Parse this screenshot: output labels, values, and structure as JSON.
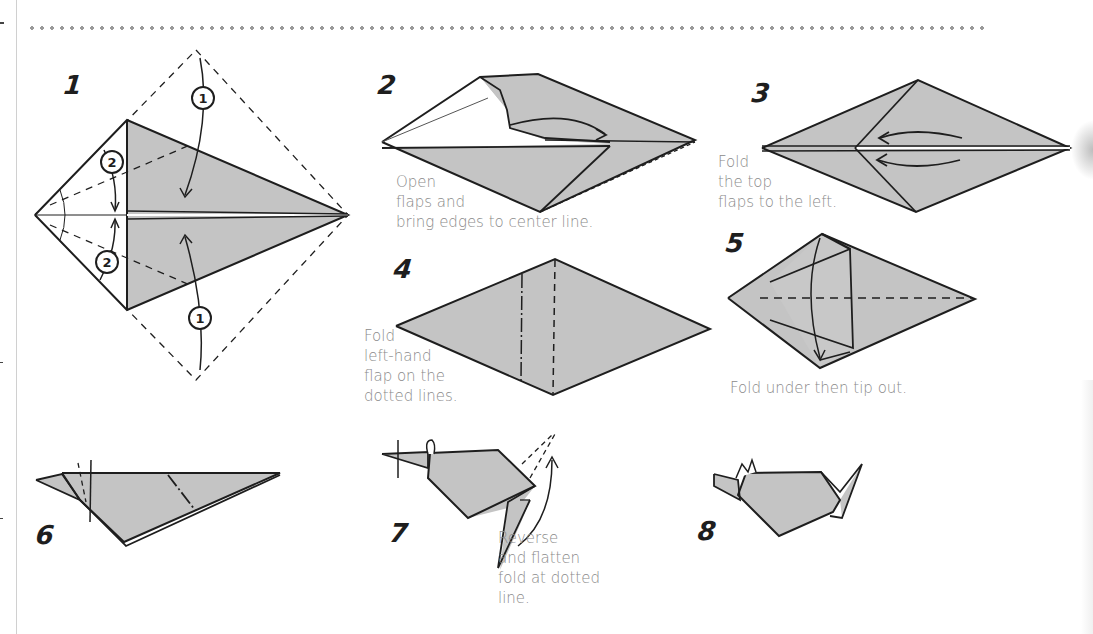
{
  "page": {
    "colors": {
      "paper": "#c4c4c4",
      "line": "#1e1e1e",
      "caption": "#8a8a8a",
      "dots": "#9a9a9a"
    }
  },
  "steps": [
    {
      "number": "1",
      "caption": ""
    },
    {
      "number": "2",
      "caption": "Open\nflaps and\nbring edges to center line."
    },
    {
      "number": "3",
      "caption": "Fold\nthe top\nflaps to the left."
    },
    {
      "number": "4",
      "caption": "Fold\nleft-hand\nflap on the\ndotted lines."
    },
    {
      "number": "5",
      "caption": "Fold under then tip out."
    },
    {
      "number": "6",
      "caption": ""
    },
    {
      "number": "7",
      "caption": "Reverse\nand flatten\nfold at dotted\nline."
    },
    {
      "number": "8",
      "caption": ""
    }
  ],
  "step1_markers": {
    "fold_a": "1",
    "fold_b": "2"
  }
}
